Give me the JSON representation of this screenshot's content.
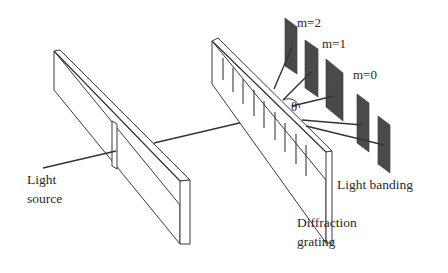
{
  "diagram": {
    "labels": {
      "light_source_line1": "Light",
      "light_source_line2": "source",
      "grating_line1": "Diffraction",
      "grating_line2": "grating",
      "light_banding": "Light banding",
      "angle": "θ",
      "orders": [
        "m=2",
        "m=1",
        "m=0"
      ]
    },
    "colors": {
      "outline": "#3a3a3a",
      "band_fill": "#4a4a4a",
      "background": "#ffffff"
    }
  }
}
